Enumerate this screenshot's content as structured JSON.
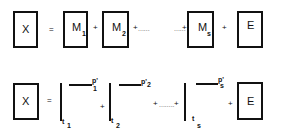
{
  "row1": {
    "lhs": "X",
    "equals": "=",
    "terms": [
      {
        "label": "M",
        "sub": "1"
      },
      {
        "label": "M",
        "sub": "2"
      },
      {
        "label": "M",
        "sub": "s"
      }
    ],
    "error": "E",
    "plus": "+",
    "ellipsis": "......"
  },
  "row2": {
    "lhs": "X",
    "equals": "=",
    "terms": [
      {
        "t": "t",
        "t_sub": "1",
        "p": "p'",
        "p_sub": "1"
      },
      {
        "t": "t",
        "t_sub": "2",
        "p": "p'",
        "p_sub": "2"
      },
      {
        "t": "t",
        "t_sub": "s",
        "p": "p'",
        "p_sub": "s"
      }
    ],
    "error": "E",
    "plus": "+",
    "ellipsis": "........"
  }
}
